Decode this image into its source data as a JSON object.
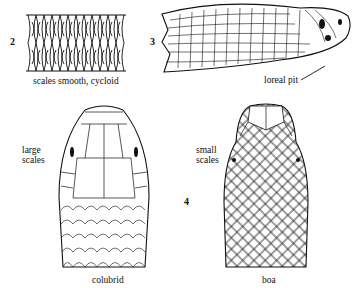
{
  "figure": {
    "panels": [
      {
        "number": "2",
        "subject": "dorsal scale patch",
        "caption": "scales smooth, cycloid"
      },
      {
        "number": "3",
        "subject": "pit viper head, lateral view",
        "annotation": "loreal pit"
      },
      {
        "number": "",
        "subject": "colubrid head, dorsal view",
        "annotation": "large\nscales",
        "annotation_lines": [
          "large",
          "scales"
        ],
        "caption": "colubrid"
      },
      {
        "number": "4",
        "subject": "boa head, dorsal view",
        "annotation_lines": [
          "small",
          "scales"
        ],
        "caption": "boa"
      }
    ],
    "colors": {
      "ink": "#111111",
      "background": "#ffffff"
    }
  }
}
